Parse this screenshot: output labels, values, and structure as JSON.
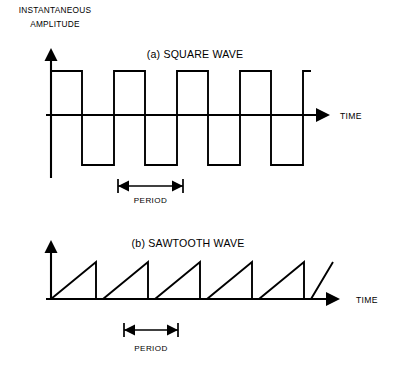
{
  "figure": {
    "axis_title_line1": "INSTANTANEOUS",
    "axis_title_line2": "AMPLITUDE",
    "stroke_color": "#000000",
    "background_color": "#ffffff"
  },
  "panels": [
    {
      "id": "square",
      "title": "(a) SQUARE WAVE",
      "time_axis_label": "TIME",
      "period_label": "PERIOD"
    },
    {
      "id": "sawtooth",
      "title": "(b) SAWTOOTH WAVE",
      "time_axis_label": "TIME",
      "period_label": "PERIOD"
    }
  ],
  "chart_data": [
    {
      "type": "line",
      "id": "square-wave",
      "title": "(a) SQUARE WAVE",
      "xlabel": "TIME",
      "ylabel": "INSTANTANEOUS AMPLITUDE",
      "waveform": "square",
      "cycles": 4,
      "period_px": 63,
      "duty_cycle": 0.5,
      "amplitude_high": 1,
      "amplitude_low": -1,
      "grid": false,
      "legend": false,
      "geometry": {
        "origin_x": 51,
        "baseline_y": 115,
        "high_y": 71,
        "low_y": 165,
        "axis_top_y": 48,
        "axis_bottom_y": 178,
        "axis_right_x": 330,
        "wave_start_x": 51,
        "wave_end_x": 311
      },
      "transitions_x": [
        51,
        82,
        114,
        145,
        177,
        208,
        240,
        271,
        303,
        311
      ],
      "period_marker": {
        "x_start": 118,
        "x_end": 183,
        "y": 186,
        "cap_half_height": 7,
        "label": "PERIOD",
        "label_y": 203
      }
    },
    {
      "type": "line",
      "id": "sawtooth-wave",
      "title": "(b) SAWTOOTH WAVE",
      "xlabel": "TIME",
      "ylabel": "INSTANTANEOUS AMPLITUDE",
      "waveform": "sawtooth",
      "cycles": 5.5,
      "period_px": 52,
      "amplitude_high": 1,
      "amplitude_low": 0,
      "grid": false,
      "legend": false,
      "geometry": {
        "origin_x": 51,
        "baseline_y": 299,
        "peak_y": 262,
        "axis_top_y": 240,
        "axis_right_x": 340,
        "wave_start_x": 51,
        "wave_end_x": 333
      },
      "ramp_starts_x": [
        51,
        103,
        155,
        207,
        259,
        311
      ],
      "peaks_x": [
        96,
        148,
        200,
        252,
        304,
        333
      ],
      "period_marker": {
        "x_start": 124,
        "x_end": 178,
        "y": 330,
        "cap_half_height": 7,
        "label": "PERIOD",
        "label_y": 351
      }
    }
  ]
}
